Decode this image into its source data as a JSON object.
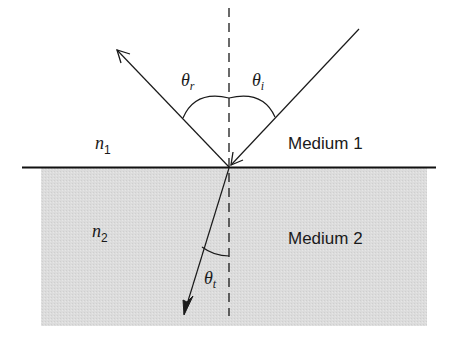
{
  "diagram": {
    "colors": {
      "medium2_fill": "#d9d9d9",
      "line": "#1a1a1a",
      "interface": "#111111"
    },
    "labels": {
      "n1": {
        "base": "n",
        "sub": "1"
      },
      "n2": {
        "base": "n",
        "sub": "2"
      },
      "medium1": "Medium 1",
      "medium2": "Medium 2",
      "theta_i": {
        "base": "θ",
        "sub": "i"
      },
      "theta_r": {
        "base": "θ",
        "sub": "r"
      },
      "theta_t": {
        "base": "θ",
        "sub": "t"
      }
    },
    "elements": {
      "normal_line": "dashed",
      "incident_ray": "arrow toward interface",
      "reflected_ray": "arrow away from interface",
      "refracted_ray": "arrow into medium 2"
    }
  }
}
